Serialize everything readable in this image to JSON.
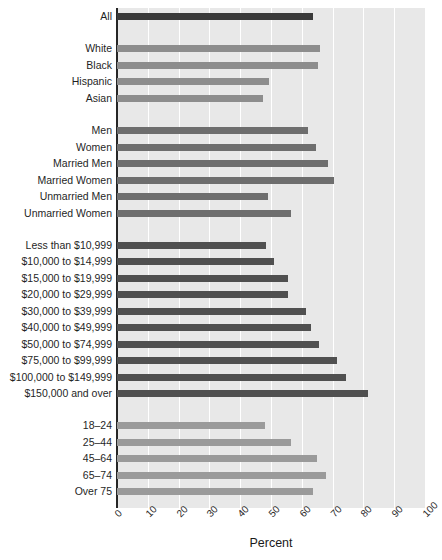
{
  "chart_data": {
    "type": "bar",
    "orientation": "horizontal",
    "title": "",
    "xlabel": "Percent",
    "ylabel": "",
    "xlim": [
      0,
      100
    ],
    "xticks": [
      "0",
      "10",
      "20",
      "30",
      "40",
      "50",
      "60",
      "70",
      "80",
      "90",
      "100"
    ],
    "xtick_values": [
      0,
      10,
      20,
      30,
      40,
      50,
      60,
      70,
      80,
      90,
      100
    ],
    "grid": "vertical-white",
    "legend": "none",
    "plot_background": "#e8e8e8",
    "groups": [
      {
        "name": "overall",
        "color": "#3a3a3a",
        "categories": [
          "All"
        ],
        "values": [
          63.5
        ]
      },
      {
        "name": "race-ethnicity",
        "color": "#8d8d8d",
        "categories": [
          "White",
          "Black",
          "Hispanic",
          "Asian"
        ],
        "values": [
          66.0,
          65.3,
          49.5,
          47.5
        ]
      },
      {
        "name": "sex-marital-status",
        "color": "#6e6e6e",
        "categories": [
          "Men",
          "Women",
          "Married Men",
          "Married Women",
          "Unmarried Men",
          "Unmarried Women"
        ],
        "values": [
          62.0,
          64.5,
          68.5,
          70.5,
          49.0,
          56.5
        ]
      },
      {
        "name": "household-income",
        "color": "#505050",
        "categories": [
          "Less than $10,999",
          "$10,000 to $14,999",
          "$15,000 to $19,999",
          "$20,000 to $29,999",
          "$30,000 to $39,999",
          "$40,000 to $49,999",
          "$50,000 to $74,999",
          "$75,000 to $99,999",
          "$100,000 to $149,999",
          "$150,000 and over"
        ],
        "values": [
          48.5,
          51.0,
          55.5,
          55.5,
          61.5,
          63.0,
          65.5,
          71.5,
          74.5,
          81.5
        ]
      },
      {
        "name": "age",
        "color": "#9a9a9a",
        "categories": [
          "18–24",
          "25–44",
          "45–64",
          "65–74",
          "Over 75"
        ],
        "values": [
          48.0,
          56.5,
          65.0,
          68.0,
          63.5
        ]
      }
    ]
  },
  "axis": {
    "x_title": "Percent"
  }
}
